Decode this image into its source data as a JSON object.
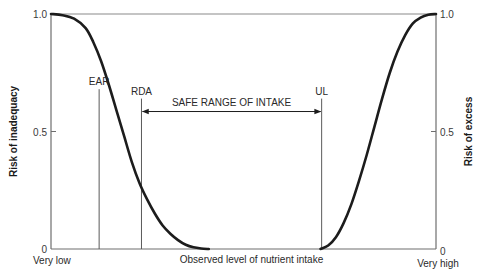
{
  "chart_data": {
    "type": "line",
    "title": "",
    "xlabel": "Observed level of nutrient intake",
    "x_range": [
      0,
      100
    ],
    "x_category_labels": {
      "low": "Very low",
      "high": "Very high"
    },
    "y_left": {
      "label": "Risk of inadequacy",
      "ylim": [
        0,
        1.0
      ],
      "ticks": [
        "0",
        "0.5",
        "1.0"
      ],
      "tick_values": [
        0,
        0.5,
        1.0
      ]
    },
    "y_right": {
      "label": "Risk of excess",
      "ylim": [
        0,
        1.0
      ],
      "ticks": [
        "0",
        "0.5",
        "1.0"
      ],
      "tick_values": [
        0,
        0.5,
        1.0
      ]
    },
    "grid": false,
    "series": [
      {
        "name": "Risk of inadequacy",
        "axis": "left",
        "x": [
          0,
          3,
          6,
          9,
          11,
          13,
          15,
          17,
          19,
          21,
          23,
          25,
          27,
          29,
          31,
          33,
          35,
          37,
          39,
          41
        ],
        "values": [
          1.0,
          0.995,
          0.98,
          0.94,
          0.88,
          0.8,
          0.7,
          0.59,
          0.48,
          0.37,
          0.28,
          0.21,
          0.15,
          0.1,
          0.065,
          0.038,
          0.018,
          0.007,
          0.002,
          0.0
        ]
      },
      {
        "name": "Risk of excess",
        "axis": "right",
        "x": [
          70,
          72,
          74,
          76,
          78,
          80,
          82,
          84,
          86,
          88,
          90,
          92,
          94,
          96,
          98,
          100
        ],
        "values": [
          0.0,
          0.015,
          0.05,
          0.11,
          0.19,
          0.29,
          0.4,
          0.52,
          0.64,
          0.75,
          0.84,
          0.91,
          0.96,
          0.985,
          0.997,
          1.0
        ]
      }
    ],
    "reference_lines": [
      {
        "name": "EAR",
        "label": "EAR",
        "x": 12.5,
        "y_top": 0.68
      },
      {
        "name": "RDA",
        "label": "RDA",
        "x": 23.5,
        "y_top": 0.64
      },
      {
        "name": "UL",
        "label": "UL",
        "x": 70.3,
        "y_top": 0.64
      }
    ],
    "annotations": [
      {
        "text": "SAFE RANGE OF INTAKE",
        "type": "double-arrow",
        "x_from": 23.5,
        "x_to": 70.3,
        "y": 0.585
      }
    ]
  },
  "colors": {
    "curve": "#1c1c1c",
    "axis": "#6e6e6e",
    "reference_line": "#5a5a5a",
    "text": "#2a2a2a"
  }
}
